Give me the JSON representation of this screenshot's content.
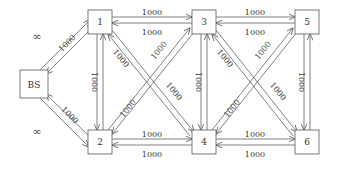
{
  "diagram": {
    "type": "network-graph",
    "nodes": [
      {
        "id": "BS",
        "label": "BS"
      },
      {
        "id": "1",
        "label": "1"
      },
      {
        "id": "2",
        "label": "2"
      },
      {
        "id": "3",
        "label": "3"
      },
      {
        "id": "4",
        "label": "4"
      },
      {
        "id": "5",
        "label": "5"
      },
      {
        "id": "6",
        "label": "6"
      }
    ],
    "edges": [
      {
        "from": "BS",
        "to": "1",
        "forward": "∞",
        "backward": "1000"
      },
      {
        "from": "BS",
        "to": "2",
        "forward": "∞",
        "backward": "1000"
      },
      {
        "from": "1",
        "to": "3",
        "forward": "1000",
        "backward": "1000"
      },
      {
        "from": "2",
        "to": "4",
        "forward": "1000",
        "backward": "1000"
      },
      {
        "from": "3",
        "to": "5",
        "forward": "1000",
        "backward": "1000"
      },
      {
        "from": "4",
        "to": "6",
        "forward": "1000",
        "backward": "1000"
      },
      {
        "from": "1",
        "to": "2",
        "label": "1000"
      },
      {
        "from": "3",
        "to": "4",
        "label": "1000"
      },
      {
        "from": "5",
        "to": "6",
        "label": "1000"
      },
      {
        "from": "1",
        "to": "4",
        "label": "1000"
      },
      {
        "from": "2",
        "to": "3",
        "label": "1000"
      },
      {
        "from": "3",
        "to": "6",
        "label": "1000"
      },
      {
        "from": "4",
        "to": "5",
        "label": "1000"
      }
    ],
    "labels": {
      "inf": "∞",
      "cap": "1000"
    }
  }
}
